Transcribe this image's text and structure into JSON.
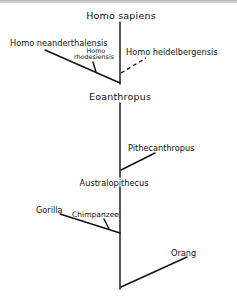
{
  "diagram": {
    "type": "phylogenetic-tree",
    "nodes": {
      "top": "Homo sapiens",
      "neanderthal": "Homo neanderthalensis",
      "rhodesiensis_line1": "Homo",
      "rhodesiensis_line2": "rhodesiensis",
      "heidelbergensis": "Homo heidelbergensis",
      "eoanthropus": "Eoanthropus",
      "pithecanthropus": "Pithecanthropus",
      "australopithecus": "Australopithecus",
      "gorilla": "Gorilla",
      "chimpanzee": "Chimpanzee",
      "orang": "Orang"
    },
    "edges": [
      {
        "from": "trunk",
        "to": "Homo sapiens",
        "style": "solid"
      },
      {
        "from": "trunk",
        "to": "Homo neanderthalensis",
        "style": "solid"
      },
      {
        "from": "Homo neanderthalensis branch",
        "to": "Homo rhodesiensis",
        "style": "solid"
      },
      {
        "from": "trunk",
        "to": "Homo heidelbergensis",
        "style": "dashed"
      },
      {
        "from": "trunk",
        "to": "Pithecanthropus",
        "style": "solid"
      },
      {
        "from": "trunk",
        "to": "Gorilla",
        "style": "solid"
      },
      {
        "from": "Gorilla branch",
        "to": "Chimpanzee",
        "style": "solid"
      },
      {
        "from": "trunk",
        "to": "Orang",
        "style": "solid"
      }
    ]
  }
}
